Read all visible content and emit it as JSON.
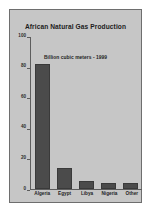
{
  "chart_data": {
    "type": "bar",
    "title": "African Natural Gas Production",
    "annotation": "Billion cubic meters - 1999",
    "categories": [
      "Algeria",
      "Egypt",
      "Libya",
      "Nigeria",
      "Other"
    ],
    "values": [
      82,
      14,
      5,
      4,
      4
    ],
    "xlabel": "",
    "ylabel": "",
    "ylim": [
      0,
      100
    ],
    "yticks": [
      0,
      20,
      40,
      60,
      80,
      100
    ],
    "ytick_labels": [
      "0",
      "20",
      "40",
      "60",
      "80",
      "100"
    ],
    "grid": false,
    "legend": false,
    "colors": {
      "bar": "#4b4b4b",
      "panel_background": "#c6c6c6",
      "page_background": "#ffffff",
      "axis": "#5d5d5d",
      "text": "#1f1f1f"
    }
  }
}
